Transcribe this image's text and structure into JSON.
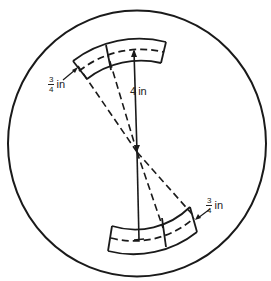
{
  "diagram": {
    "type": "circle with two curved arc segments and radial lines",
    "colors": {
      "stroke": "#1a1a1a",
      "background": "#ffffff",
      "text": "#222222"
    },
    "labels": {
      "radius": {
        "value": "4",
        "unit": "in"
      },
      "upper_width": {
        "numerator": "3",
        "denominator": "4",
        "unit": "in"
      },
      "lower_width": {
        "numerator": "3",
        "denominator": "4",
        "unit": "in"
      }
    }
  }
}
